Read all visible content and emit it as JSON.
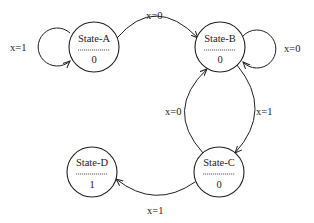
{
  "diagram": {
    "type": "state-machine",
    "states": [
      {
        "id": "A",
        "name": "State-A",
        "output": "0"
      },
      {
        "id": "B",
        "name": "State-B",
        "output": "0"
      },
      {
        "id": "C",
        "name": "State-C",
        "output": "0"
      },
      {
        "id": "D",
        "name": "State-D",
        "output": "1"
      }
    ],
    "transitions": [
      {
        "from": "A",
        "to": "A",
        "label": "x=1"
      },
      {
        "from": "A",
        "to": "B",
        "label": "x=0"
      },
      {
        "from": "B",
        "to": "B",
        "label": "x=0"
      },
      {
        "from": "C",
        "to": "B",
        "label": "x=0"
      },
      {
        "from": "B",
        "to": "C",
        "label": "x=1"
      },
      {
        "from": "C",
        "to": "D",
        "label": "x=1"
      }
    ],
    "divider_text": "----------",
    "colors": {
      "stroke": "#222222",
      "background": "#ffffff"
    }
  }
}
